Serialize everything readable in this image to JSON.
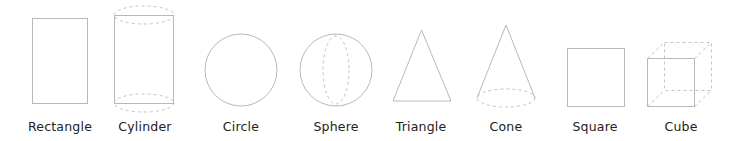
{
  "colors": {
    "stroke": "#b8b8b8",
    "dashed": "#c4c4c4",
    "label": "#222222",
    "background": "#ffffff"
  },
  "shapes": [
    {
      "id": "rectangle",
      "label": "Rectangle",
      "icon": "rectangle-icon",
      "label_center_x": 60
    },
    {
      "id": "cylinder",
      "label": "Cylinder",
      "icon": "cylinder-icon",
      "label_center_x": 145
    },
    {
      "id": "circle",
      "label": "Circle",
      "icon": "circle-icon",
      "label_center_x": 241
    },
    {
      "id": "sphere",
      "label": "Sphere",
      "icon": "sphere-icon",
      "label_center_x": 336
    },
    {
      "id": "triangle",
      "label": "Triangle",
      "icon": "triangle-icon",
      "label_center_x": 421
    },
    {
      "id": "cone",
      "label": "Cone",
      "icon": "cone-icon",
      "label_center_x": 506
    },
    {
      "id": "square",
      "label": "Square",
      "icon": "square-icon",
      "label_center_x": 595
    },
    {
      "id": "cube",
      "label": "Cube",
      "icon": "cube-icon",
      "label_center_x": 681
    }
  ]
}
